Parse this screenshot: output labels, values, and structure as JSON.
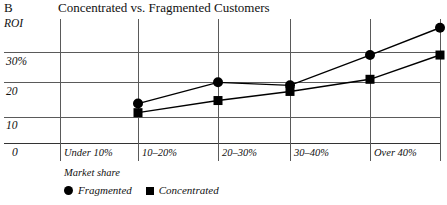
{
  "panel": {
    "letter": "B"
  },
  "header": {
    "title": "Concentrated vs. Fragmented Customers"
  },
  "chart_data": {
    "type": "line",
    "title": "Concentrated vs. Fragmented Customers",
    "xlabel": "Market share",
    "ylabel": "ROI",
    "categories": [
      "Under 10%",
      "10–20%",
      "20–30%",
      "30–40%",
      "Over 40%"
    ],
    "ytick_labels": [
      "0",
      "10",
      "20",
      "30%"
    ],
    "ytick_values": [
      0,
      10,
      20,
      30
    ],
    "ylim": [
      0,
      41
    ],
    "grid": true,
    "legend_position": "bottom-left",
    "series": [
      {
        "name": "Fragmented",
        "marker": "circle",
        "color": "#000000",
        "values": [
          13,
          20,
          19,
          29,
          38
        ]
      },
      {
        "name": "Concentrated",
        "marker": "square",
        "color": "#000000",
        "values": [
          10,
          14,
          17,
          21,
          29
        ]
      }
    ]
  },
  "legend": {
    "items": [
      {
        "label": "Fragmented",
        "marker": "circle-marker-icon"
      },
      {
        "label": "Concentrated",
        "marker": "square-marker-icon"
      }
    ]
  }
}
